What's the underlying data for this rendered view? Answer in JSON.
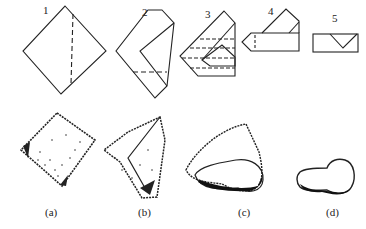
{
  "steps": [
    {
      "number": "1"
    },
    {
      "number": "2"
    },
    {
      "number": "3"
    },
    {
      "number": "4"
    },
    {
      "number": "5"
    }
  ],
  "results": [
    {
      "label": "(a)"
    },
    {
      "label": "(b)"
    },
    {
      "label": "(c)"
    },
    {
      "label": "(d)"
    }
  ],
  "colors": {
    "ink": "#222222",
    "background": "#ffffff"
  }
}
